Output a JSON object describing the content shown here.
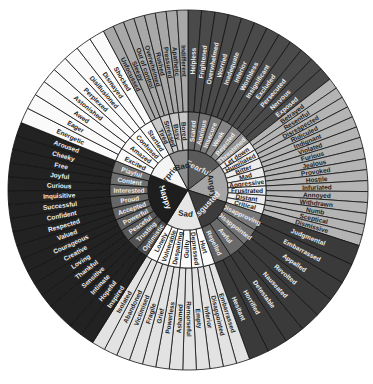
{
  "center": {
    "cx": 188,
    "cy": 190
  },
  "radii": {
    "core": 40,
    "middle": 78,
    "outer": 180
  },
  "core": [
    {
      "label": "Fearful",
      "color": "#5a5a5a",
      "text": "#dddddd",
      "start": 0,
      "end": 52
    },
    {
      "label": "Angry",
      "color": "#a6a6a6",
      "text": "#222222",
      "start": 52,
      "end": 108
    },
    {
      "label": "Disgusted",
      "color": "#3c3c3c",
      "text": "#eeeeee",
      "start": 108,
      "end": 160
    },
    {
      "label": "Sad",
      "color": "#e6e6e6",
      "text": "#222222",
      "start": 160,
      "end": 212
    },
    {
      "label": "Happy",
      "color": "#1e1e1e",
      "text": "#ffffff",
      "start": 212,
      "end": 292
    },
    {
      "label": "Surprised",
      "color": "#f4f4f4",
      "text": "#222222",
      "start": 292,
      "end": 332
    },
    {
      "label": "Bad",
      "color": "#8f8f8f",
      "text": "#222222",
      "start": 332,
      "end": 360
    }
  ],
  "middle": [
    {
      "label": "Scared",
      "color": "#6a6a6a",
      "text": "#eeeeee"
    },
    {
      "label": "Anxious",
      "color": "#737373",
      "text": "#eeeeee"
    },
    {
      "label": "Insecure",
      "color": "#7b7b7b",
      "text": "#eeeeee"
    },
    {
      "label": "Weak",
      "color": "#858585",
      "text": "#eeeeee"
    },
    {
      "label": "Rejected",
      "color": "#8c8c8c",
      "text": "#eeeeee"
    },
    {
      "label": "Threatened",
      "color": "#959595",
      "text": "#eeeeee"
    },
    {
      "label": "Let down",
      "color": "#ececec",
      "text": "#222222"
    },
    {
      "label": "Humiliated",
      "color": "#ececec",
      "text": "#222222"
    },
    {
      "label": "Bitter",
      "color": "#ececec",
      "text": "#222222"
    },
    {
      "label": "Mad",
      "color": "#ececec",
      "text": "#222222"
    },
    {
      "label": "Aggressive",
      "color": "#ececec",
      "text": "#222222"
    },
    {
      "label": "Frustrated",
      "color": "#ececec",
      "text": "#222222"
    },
    {
      "label": "Distant",
      "color": "#ececec",
      "text": "#222222"
    },
    {
      "label": "Critical",
      "color": "#ececec",
      "text": "#222222"
    },
    {
      "label": "Disapproving",
      "color": "#7a7a7a",
      "text": "#eeeeee"
    },
    {
      "label": "Disappointed",
      "color": "#727272",
      "text": "#eeeeee"
    },
    {
      "label": "Awful",
      "color": "#6a6a6a",
      "text": "#eeeeee"
    },
    {
      "label": "Repelled",
      "color": "#626262",
      "text": "#eeeeee"
    },
    {
      "label": "Hurt",
      "color": "#fafafa",
      "text": "#222222"
    },
    {
      "label": "Depressed",
      "color": "#fafafa",
      "text": "#222222"
    },
    {
      "label": "Guilty",
      "color": "#fafafa",
      "text": "#222222"
    },
    {
      "label": "Despairing",
      "color": "#fafafa",
      "text": "#222222"
    },
    {
      "label": "Vulnerable",
      "color": "#fafafa",
      "text": "#222222"
    },
    {
      "label": "Lonely",
      "color": "#fafafa",
      "text": "#222222"
    },
    {
      "label": "Optimistic",
      "color": "#4a4a4a",
      "text": "#eeeeee"
    },
    {
      "label": "Trusting",
      "color": "#525252",
      "text": "#eeeeee"
    },
    {
      "label": "Peaceful",
      "color": "#585858",
      "text": "#eeeeee"
    },
    {
      "label": "Powerful",
      "color": "#5e5e5e",
      "text": "#eeeeee"
    },
    {
      "label": "Accepted",
      "color": "#626262",
      "text": "#eeeeee"
    },
    {
      "label": "Proud",
      "color": "#666666",
      "text": "#eeeeee"
    },
    {
      "label": "Interested",
      "color": "#6a6a6a",
      "text": "#eeeeee"
    },
    {
      "label": "Content",
      "color": "#6e6e6e",
      "text": "#eeeeee"
    },
    {
      "label": "Playful",
      "color": "#727272",
      "text": "#eeeeee"
    },
    {
      "label": "Excited",
      "color": "#fafafa",
      "text": "#222222"
    },
    {
      "label": "Amazed",
      "color": "#fafafa",
      "text": "#222222"
    },
    {
      "label": "Confused",
      "color": "#fafafa",
      "text": "#222222"
    },
    {
      "label": "Startled",
      "color": "#fafafa",
      "text": "#222222"
    },
    {
      "label": "Tired",
      "color": "#c8c8c8",
      "text": "#222222"
    },
    {
      "label": "Stressed",
      "color": "#c8c8c8",
      "text": "#222222"
    },
    {
      "label": "Busy",
      "color": "#c8c8c8",
      "text": "#222222"
    },
    {
      "label": "Bored",
      "color": "#c8c8c8",
      "text": "#222222"
    }
  ],
  "outer": [
    {
      "label": "Helpless",
      "color": "#4a4a4a",
      "text": "#eeeeee"
    },
    {
      "label": "Frightened",
      "color": "#4a4a4a",
      "text": "#eeeeee"
    },
    {
      "label": "Overwhelmed",
      "color": "#4a4a4a",
      "text": "#eeeeee"
    },
    {
      "label": "Worried",
      "color": "#4a4a4a",
      "text": "#eeeeee"
    },
    {
      "label": "Inadequate",
      "color": "#4a4a4a",
      "text": "#eeeeee"
    },
    {
      "label": "Inferior",
      "color": "#4a4a4a",
      "text": "#eeeeee"
    },
    {
      "label": "Worthless",
      "color": "#4a4a4a",
      "text": "#eeeeee"
    },
    {
      "label": "Insignificant",
      "color": "#4a4a4a",
      "text": "#eeeeee"
    },
    {
      "label": "Excluded",
      "color": "#4a4a4a",
      "text": "#eeeeee"
    },
    {
      "label": "Persecuted",
      "color": "#4a4a4a",
      "text": "#eeeeee"
    },
    {
      "label": "Nervous",
      "color": "#4a4a4a",
      "text": "#eeeeee"
    },
    {
      "label": "Exposed",
      "color": "#4a4a4a",
      "text": "#eeeeee"
    },
    {
      "label": "Betrayed",
      "color": "#b4b4b4",
      "text": "#222222"
    },
    {
      "label": "Resentful",
      "color": "#b4b4b4",
      "text": "#222222"
    },
    {
      "label": "Disrespected",
      "color": "#b4b4b4",
      "text": "#222222"
    },
    {
      "label": "Ridiculed",
      "color": "#b4b4b4",
      "text": "#222222"
    },
    {
      "label": "Indignant",
      "color": "#b4b4b4",
      "text": "#222222"
    },
    {
      "label": "Violated",
      "color": "#b4b4b4",
      "text": "#222222"
    },
    {
      "label": "Furious",
      "color": "#b4b4b4",
      "text": "#222222"
    },
    {
      "label": "Jealous",
      "color": "#b4b4b4",
      "text": "#222222"
    },
    {
      "label": "Provoked",
      "color": "#b4b4b4",
      "text": "#222222"
    },
    {
      "label": "Hostile",
      "color": "#b4b4b4",
      "text": "#222222"
    },
    {
      "label": "Infuriated",
      "color": "#b4b4b4",
      "text": "#222222"
    },
    {
      "label": "Annoyed",
      "color": "#b4b4b4",
      "text": "#222222"
    },
    {
      "label": "Withdrawn",
      "color": "#b4b4b4",
      "text": "#222222"
    },
    {
      "label": "Numb",
      "color": "#b4b4b4",
      "text": "#222222"
    },
    {
      "label": "Sceptical",
      "color": "#b4b4b4",
      "text": "#222222"
    },
    {
      "label": "Dismissive",
      "color": "#b4b4b4",
      "text": "#222222"
    },
    {
      "label": "Judgmental",
      "color": "#3a3a3a",
      "text": "#eeeeee"
    },
    {
      "label": "Embarrassed",
      "color": "#3a3a3a",
      "text": "#eeeeee"
    },
    {
      "label": "Appalled",
      "color": "#3a3a3a",
      "text": "#eeeeee"
    },
    {
      "label": "Revolted",
      "color": "#3a3a3a",
      "text": "#eeeeee"
    },
    {
      "label": "Nauseated",
      "color": "#3a3a3a",
      "text": "#eeeeee"
    },
    {
      "label": "Detestable",
      "color": "#3a3a3a",
      "text": "#eeeeee"
    },
    {
      "label": "Horrified",
      "color": "#3a3a3a",
      "text": "#eeeeee"
    },
    {
      "label": "Hesitant",
      "color": "#3a3a3a",
      "text": "#eeeeee"
    },
    {
      "label": "Embarrassed",
      "color": "#e2e2e2",
      "text": "#222222"
    },
    {
      "label": "Disappointed",
      "color": "#e2e2e2",
      "text": "#222222"
    },
    {
      "label": "Inferior",
      "color": "#e2e2e2",
      "text": "#222222"
    },
    {
      "label": "Empty",
      "color": "#e2e2e2",
      "text": "#222222"
    },
    {
      "label": "Remorseful",
      "color": "#e2e2e2",
      "text": "#222222"
    },
    {
      "label": "Ashamed",
      "color": "#e2e2e2",
      "text": "#222222"
    },
    {
      "label": "Powerless",
      "color": "#e2e2e2",
      "text": "#222222"
    },
    {
      "label": "Grief",
      "color": "#e2e2e2",
      "text": "#222222"
    },
    {
      "label": "Fragile",
      "color": "#e2e2e2",
      "text": "#222222"
    },
    {
      "label": "Victimised",
      "color": "#e2e2e2",
      "text": "#222222"
    },
    {
      "label": "Abandoned",
      "color": "#e2e2e2",
      "text": "#222222"
    },
    {
      "label": "Isolated",
      "color": "#e2e2e2",
      "text": "#222222"
    },
    {
      "label": "Inspired",
      "color": "#222222",
      "text": "#eeeeee"
    },
    {
      "label": "Hopeful",
      "color": "#222222",
      "text": "#eeeeee"
    },
    {
      "label": "Intimate",
      "color": "#222222",
      "text": "#eeeeee"
    },
    {
      "label": "Sensitive",
      "color": "#222222",
      "text": "#eeeeee"
    },
    {
      "label": "Thankful",
      "color": "#222222",
      "text": "#eeeeee"
    },
    {
      "label": "Loving",
      "color": "#222222",
      "text": "#eeeeee"
    },
    {
      "label": "Creative",
      "color": "#222222",
      "text": "#eeeeee"
    },
    {
      "label": "Courageous",
      "color": "#222222",
      "text": "#eeeeee"
    },
    {
      "label": "Valued",
      "color": "#222222",
      "text": "#eeeeee"
    },
    {
      "label": "Respected",
      "color": "#222222",
      "text": "#eeeeee"
    },
    {
      "label": "Confident",
      "color": "#222222",
      "text": "#eeeeee"
    },
    {
      "label": "Successful",
      "color": "#222222",
      "text": "#eeeeee"
    },
    {
      "label": "Inquisitive",
      "color": "#222222",
      "text": "#eeeeee"
    },
    {
      "label": "Curious",
      "color": "#222222",
      "text": "#eeeeee"
    },
    {
      "label": "Joyful",
      "color": "#222222",
      "text": "#eeeeee"
    },
    {
      "label": "Free",
      "color": "#222222",
      "text": "#eeeeee"
    },
    {
      "label": "Cheeky",
      "color": "#222222",
      "text": "#eeeeee"
    },
    {
      "label": "Aroused",
      "color": "#222222",
      "text": "#eeeeee"
    },
    {
      "label": "Energetic",
      "color": "#fafafa",
      "text": "#222222"
    },
    {
      "label": "Eager",
      "color": "#fafafa",
      "text": "#222222"
    },
    {
      "label": "Awed",
      "color": "#fafafa",
      "text": "#222222"
    },
    {
      "label": "Astonished",
      "color": "#fafafa",
      "text": "#222222"
    },
    {
      "label": "Perplexed",
      "color": "#fafafa",
      "text": "#222222"
    },
    {
      "label": "Disillusioned",
      "color": "#fafafa",
      "text": "#222222"
    },
    {
      "label": "Dismayed",
      "color": "#fafafa",
      "text": "#222222"
    },
    {
      "label": "Shocked",
      "color": "#fafafa",
      "text": "#222222"
    },
    {
      "label": "Unfocussed",
      "color": "#a8a8a8",
      "text": "#222222"
    },
    {
      "label": "Sleepy",
      "color": "#a8a8a8",
      "text": "#222222"
    },
    {
      "label": "Out of control",
      "color": "#a8a8a8",
      "text": "#222222"
    },
    {
      "label": "Overwhelmed",
      "color": "#a8a8a8",
      "text": "#222222"
    },
    {
      "label": "Rushed",
      "color": "#a8a8a8",
      "text": "#222222"
    },
    {
      "label": "Pressured",
      "color": "#a8a8a8",
      "text": "#222222"
    },
    {
      "label": "Apathetic",
      "color": "#a8a8a8",
      "text": "#222222"
    },
    {
      "label": "Indifferent",
      "color": "#a8a8a8",
      "text": "#222222"
    }
  ]
}
